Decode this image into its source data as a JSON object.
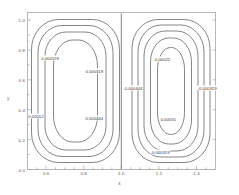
{
  "chart_data": {
    "type": "line",
    "subtype": "contour",
    "title": "",
    "xlabel": "x",
    "ylabel": "y",
    "xlim": [
      0.5,
      1.5
    ],
    "ylim": [
      0.0,
      1.05
    ],
    "xticks": [
      "0.6",
      "0.8",
      "1.0",
      "1.2",
      "1.4"
    ],
    "xtick_values": [
      0.6,
      0.8,
      1.0,
      1.2,
      1.4
    ],
    "yticks": [
      "0.0",
      "0.2",
      "0.4",
      "0.6",
      "0.8",
      "1.0"
    ],
    "ytick_values": [
      0.0,
      0.2,
      0.4,
      0.6,
      0.8,
      1.0
    ],
    "grid": false,
    "legend": "none",
    "line_color": "#444444",
    "axis_color": "#888888",
    "background": "#ffffff",
    "lobes": [
      {
        "name": "left-lobe",
        "sign": "positive",
        "center": [
          0.75,
          0.5
        ],
        "levels": [
          0.00012,
          0.000159,
          0.00022,
          0.000319
        ]
      },
      {
        "name": "right-lobe",
        "sign": "negative",
        "center": [
          1.25,
          0.5
        ],
        "levels": [
          -0.00022,
          -0.00044,
          -0.00055,
          -0.000319
        ]
      }
    ],
    "contour_labels": [
      {
        "text": "0.000159",
        "x": 0.62,
        "y": 0.745
      },
      {
        "text": "0.000319",
        "x": 0.855,
        "y": 0.66
      },
      {
        "text": "0.00012",
        "x": 0.545,
        "y": 0.355
      },
      {
        "text": "0.000444",
        "x": 0.855,
        "y": 0.345
      },
      {
        "text": "-0.00022",
        "x": 1.215,
        "y": 0.742
      },
      {
        "text": "-0.000444",
        "x": 1.06,
        "y": 0.545
      },
      {
        "text": "-0.000319",
        "x": 1.455,
        "y": 0.545
      },
      {
        "text": "-0.00055",
        "x": 1.245,
        "y": 0.34
      },
      {
        "text": "-0.000319",
        "x": 1.205,
        "y": 0.115
      }
    ]
  }
}
